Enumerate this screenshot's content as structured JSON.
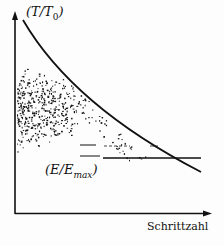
{
  "chart_data": {
    "type": "line",
    "title": "",
    "xlabel": "Schrittzahl",
    "ylabel": "(T/T0)",
    "xlim": [
      0,
      1
    ],
    "ylim": [
      0,
      1
    ],
    "grid": false,
    "legend": null,
    "series": [
      {
        "name": "(T/T0)",
        "kind": "curve",
        "description": "Exponentially decaying temperature schedule",
        "x": [
          0.0,
          0.1,
          0.2,
          0.3,
          0.4,
          0.5,
          0.6,
          0.7,
          0.8,
          0.9,
          0.95
        ],
        "y": [
          1.0,
          0.84,
          0.71,
          0.61,
          0.53,
          0.46,
          0.4,
          0.35,
          0.3,
          0.27,
          0.25
        ]
      },
      {
        "name": "(E/Emax)",
        "kind": "scatter",
        "description": "Dense cloud of energy samples at left, thinning and converging to a horizontal level",
        "converged_level": 0.3
      },
      {
        "name": "E_final",
        "kind": "hline",
        "y": 0.3,
        "x_range": [
          0.2,
          0.95
        ]
      }
    ],
    "annotations": [
      {
        "text": "(T/T0)",
        "position": "top-left near y-axis"
      },
      {
        "text": "(E/Emax)",
        "position": "below scatter near converged line"
      }
    ]
  },
  "labels": {
    "y_axis": "(T/T",
    "y_axis_sub": "0",
    "y_axis_close": ")",
    "energy": "(E/E",
    "energy_sub": "max",
    "energy_close": ")",
    "x_axis": "Schrittzahl"
  }
}
